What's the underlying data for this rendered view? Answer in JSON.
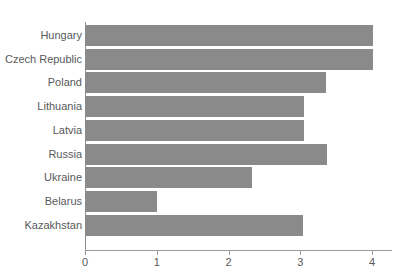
{
  "chart_data": {
    "type": "bar",
    "orientation": "horizontal",
    "title": "",
    "xlabel": "",
    "ylabel": "",
    "categories": [
      "Hungary",
      "Czech Republic",
      "Poland",
      "Lithuania",
      "Latvia",
      "Russia",
      "Ukraine",
      "Belarus",
      "Kazakhstan"
    ],
    "values": [
      4.02,
      4.02,
      3.36,
      3.05,
      3.05,
      3.37,
      2.33,
      1.0,
      3.04
    ],
    "xlim": [
      0,
      4.28
    ],
    "xticks": [
      0,
      1,
      2,
      3,
      4
    ],
    "xtick_labels": [
      "0",
      "1",
      "2",
      "3",
      "4"
    ],
    "grid": false,
    "legend": false,
    "bar_color": "#8a8a8a",
    "axis_color": "#9a9a9a",
    "text_color": "#58595b"
  },
  "axes": {
    "x_ticks": [
      {
        "label": "0",
        "value": 0
      },
      {
        "label": "1",
        "value": 1
      },
      {
        "label": "2",
        "value": 2
      },
      {
        "label": "3",
        "value": 3
      },
      {
        "label": "4",
        "value": 4
      }
    ]
  }
}
